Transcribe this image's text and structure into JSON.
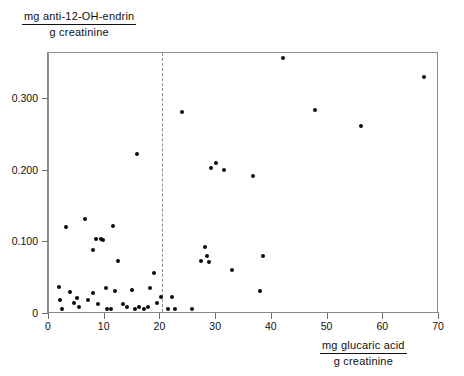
{
  "chart_data": {
    "type": "scatter",
    "title": "",
    "xlabel": "mg glucaric acid / g creatinine",
    "ylabel": "mg anti-12-OH-endrin / g creatinine",
    "xlabel_numerator": "mg glucaric acid",
    "xlabel_denominator": "g creatinine",
    "ylabel_numerator": "mg anti-12-OH-endrin",
    "ylabel_denominator": "g creatinine",
    "xlim": [
      0,
      70
    ],
    "ylim": [
      0,
      0.3643
    ],
    "xticks": [
      0,
      10,
      20,
      30,
      40,
      50,
      60,
      70
    ],
    "xticklabels": [
      "0",
      "10",
      "20",
      "30",
      "40",
      "50",
      "60",
      "70"
    ],
    "yticks": [
      0,
      0.1,
      0.2,
      0.3
    ],
    "yticklabels": [
      "0",
      "0.100",
      "0.200",
      "0.300"
    ],
    "grid": false,
    "legend": null,
    "marker": "filled-circle",
    "marker_color": "#0b0b0b",
    "frame_color": "#8d8d8d",
    "annotations": [
      {
        "type": "vertical-dashed-line",
        "name": "threshold-line",
        "x": 20.5,
        "color": "#8c8c8c",
        "style": "dashed"
      }
    ],
    "points": [
      {
        "x": 2.0,
        "y": 0.036
      },
      {
        "x": 2.2,
        "y": 0.018
      },
      {
        "x": 2.5,
        "y": 0.006
      },
      {
        "x": 3.3,
        "y": 0.12
      },
      {
        "x": 4.0,
        "y": 0.03
      },
      {
        "x": 4.6,
        "y": 0.014
      },
      {
        "x": 5.2,
        "y": 0.021
      },
      {
        "x": 5.6,
        "y": 0.008
      },
      {
        "x": 6.6,
        "y": 0.131
      },
      {
        "x": 7.2,
        "y": 0.018
      },
      {
        "x": 8.0,
        "y": 0.088
      },
      {
        "x": 8.1,
        "y": 0.028
      },
      {
        "x": 8.6,
        "y": 0.103
      },
      {
        "x": 9.0,
        "y": 0.013
      },
      {
        "x": 9.5,
        "y": 0.103
      },
      {
        "x": 9.9,
        "y": 0.102
      },
      {
        "x": 10.4,
        "y": 0.035
      },
      {
        "x": 10.6,
        "y": 0.006
      },
      {
        "x": 11.3,
        "y": 0.006
      },
      {
        "x": 11.6,
        "y": 0.121
      },
      {
        "x": 12.0,
        "y": 0.031
      },
      {
        "x": 12.6,
        "y": 0.072
      },
      {
        "x": 13.4,
        "y": 0.013
      },
      {
        "x": 14.2,
        "y": 0.009
      },
      {
        "x": 15.1,
        "y": 0.032
      },
      {
        "x": 15.6,
        "y": 0.006
      },
      {
        "x": 16.0,
        "y": 0.222
      },
      {
        "x": 16.3,
        "y": 0.008
      },
      {
        "x": 17.2,
        "y": 0.006
      },
      {
        "x": 17.9,
        "y": 0.008
      },
      {
        "x": 18.3,
        "y": 0.035
      },
      {
        "x": 19.0,
        "y": 0.056
      },
      {
        "x": 19.6,
        "y": 0.014
      },
      {
        "x": 20.2,
        "y": 0.023
      },
      {
        "x": 21.5,
        "y": 0.006
      },
      {
        "x": 22.3,
        "y": 0.023
      },
      {
        "x": 22.8,
        "y": 0.005
      },
      {
        "x": 24.0,
        "y": 0.28
      },
      {
        "x": 25.8,
        "y": 0.005
      },
      {
        "x": 27.4,
        "y": 0.072
      },
      {
        "x": 28.2,
        "y": 0.092
      },
      {
        "x": 28.6,
        "y": 0.079
      },
      {
        "x": 28.9,
        "y": 0.071
      },
      {
        "x": 29.2,
        "y": 0.203
      },
      {
        "x": 30.1,
        "y": 0.21
      },
      {
        "x": 31.6,
        "y": 0.199
      },
      {
        "x": 33.0,
        "y": 0.06
      },
      {
        "x": 36.8,
        "y": 0.191
      },
      {
        "x": 38.1,
        "y": 0.031
      },
      {
        "x": 38.6,
        "y": 0.08
      },
      {
        "x": 42.1,
        "y": 0.356
      },
      {
        "x": 47.9,
        "y": 0.283
      },
      {
        "x": 56.1,
        "y": 0.261
      },
      {
        "x": 67.4,
        "y": 0.33
      }
    ]
  }
}
